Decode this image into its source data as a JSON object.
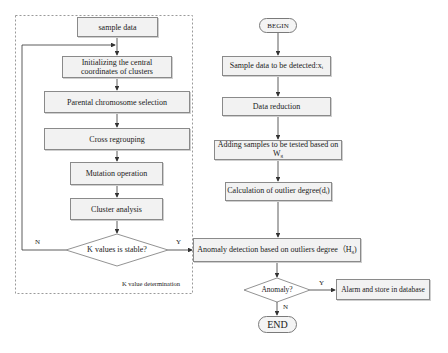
{
  "diagram": {
    "group_label": "K value determination",
    "left_flow": {
      "sample_data": "sample data",
      "init_clusters": "Initializing the central coordinates of clusters",
      "parental_selection": "Parental chromosome selection",
      "cross_regrouping": "Cross regrouping",
      "mutation": "Mutation operation",
      "cluster_analysis": "Cluster analysis",
      "k_stable_decision": "K values is stable?",
      "no_label": "N",
      "yes_label": "Y"
    },
    "right_flow": {
      "begin": "BEGIN",
      "sample_detect": "Sample data to be detected:x",
      "sample_detect_sub": "i",
      "data_reduction": "Data reduction",
      "adding_samples": "Adding samples to be tested based on W",
      "adding_samples_sub": "g",
      "outlier_calc": "Calculation of outlier degree(d",
      "outlier_calc_sub": "i",
      "outlier_calc_close": ")",
      "anomaly_detection": "Anomaly detection based on outliers degree（H",
      "anomaly_detection_sub": "g",
      "anomaly_detection_close": ")",
      "anomaly_decision": "Anomaly?",
      "yes_label": "Y",
      "no_label": "N",
      "alarm": "Alarm and store in database",
      "end": "END"
    }
  }
}
